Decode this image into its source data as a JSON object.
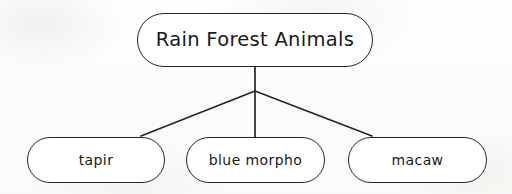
{
  "diagram": {
    "type": "concept-map",
    "title": "Rain Forest Animals",
    "background_color": "#fdfdfc",
    "line_color": "#252525",
    "node_fill": "#ffffff",
    "text_color": "#1a1a1a",
    "root": {
      "id": "root",
      "label": "Rain Forest Animals",
      "shape": "rounded-rectangle",
      "x": 137,
      "y": 13,
      "width": 236,
      "height": 54
    },
    "children": [
      {
        "id": "tapir",
        "label": "tapir",
        "shape": "rounded-rectangle",
        "x": 27,
        "y": 137,
        "width": 138,
        "height": 46
      },
      {
        "id": "blue-morpho",
        "label": "blue morpho",
        "shape": "rounded-rectangle",
        "x": 186,
        "y": 137,
        "width": 139,
        "height": 46
      },
      {
        "id": "macaw",
        "label": "macaw",
        "shape": "rounded-rectangle",
        "x": 348,
        "y": 137,
        "width": 139,
        "height": 46
      }
    ],
    "junction": {
      "x": 255,
      "y": 91
    },
    "connectors": [
      {
        "id": "root-to-junction",
        "from": "root",
        "to": "junction",
        "points": "255,67 255,91"
      },
      {
        "id": "junction-to-tapir",
        "from": "junction",
        "to": "tapir",
        "points": "255,91 141,136"
      },
      {
        "id": "junction-to-blue-morpho",
        "from": "junction",
        "to": "blue-morpho",
        "points": "255,91 255,137"
      },
      {
        "id": "junction-to-macaw",
        "from": "junction",
        "to": "macaw",
        "points": "255,91 372,136"
      }
    ]
  }
}
